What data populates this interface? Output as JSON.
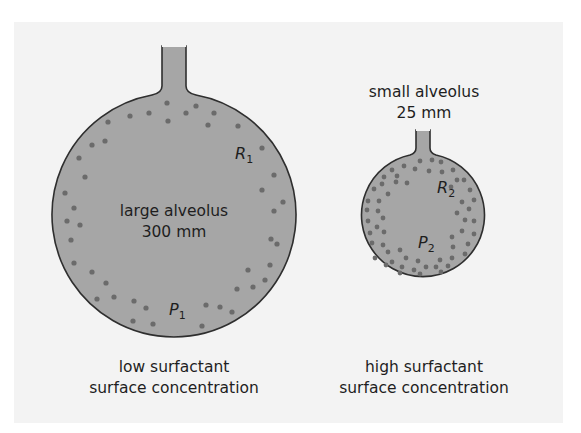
{
  "diagram": {
    "colors": {
      "panel_bg": "#f3f3f3",
      "alveolus_fill": "#a6a6a6",
      "outline": "#2e2e2e",
      "surfactant_dot": "#6b6b6b",
      "text": "#1e1e1e"
    },
    "large_alveolus": {
      "label_line1": "large alveolus",
      "label_line2": "300 mm",
      "radius_symbol": "R",
      "radius_sub": "1",
      "pressure_symbol": "P",
      "pressure_sub": "1",
      "caption_line1": "low surfactant",
      "caption_line2": "surface concentration"
    },
    "small_alveolus": {
      "label_line1": "small alveolus",
      "label_line2": "25 mm",
      "radius_symbol": "R",
      "radius_sub": "2",
      "pressure_symbol": "P",
      "pressure_sub": "2",
      "caption_line1": "high surfactant",
      "caption_line2": "surface concentration"
    }
  }
}
